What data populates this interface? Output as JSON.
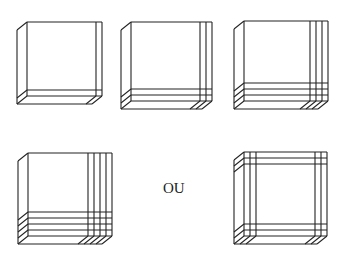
{
  "figures": [
    {
      "id": "box-1",
      "cuts_right": 1,
      "cuts_bottom": 1,
      "cuts_left": 0,
      "cuts_top": 0
    },
    {
      "id": "box-2",
      "cuts_right": 2,
      "cuts_bottom": 2,
      "cuts_left": 0,
      "cuts_top": 0
    },
    {
      "id": "box-3",
      "cuts_right": 3,
      "cuts_bottom": 3,
      "cuts_left": 0,
      "cuts_top": 0
    },
    {
      "id": "box-4",
      "cuts_right": 4,
      "cuts_bottom": 4,
      "cuts_left": 0,
      "cuts_top": 0
    },
    {
      "id": "box-5",
      "cuts_right": 2,
      "cuts_bottom": 2,
      "cuts_left": 2,
      "cuts_top": 2
    }
  ],
  "separator_text": "OU",
  "line_color": "#222222"
}
